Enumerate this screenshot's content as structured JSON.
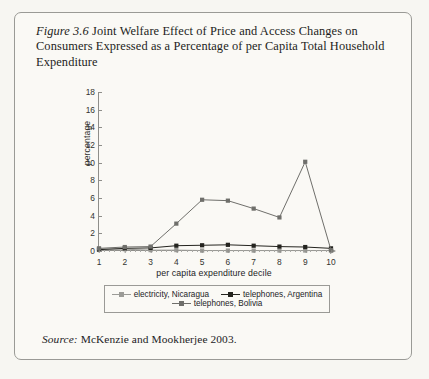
{
  "figure": {
    "number": "Figure 3.6",
    "title": " Joint Welfare Effect of Price and Access Changes on Consumers Expressed as a Percentage of per Capita Total Household Expenditure",
    "source_label": "Source:",
    "source_text": " McKenzie and Mookherjee 2003."
  },
  "chart_data": {
    "type": "line",
    "title": "",
    "xlabel": "per capita expenditure decile",
    "ylabel": "percentage",
    "categories": [
      1,
      2,
      3,
      4,
      5,
      6,
      7,
      8,
      9,
      10
    ],
    "x": [
      1,
      2,
      3,
      4,
      5,
      6,
      7,
      8,
      9,
      10
    ],
    "xlim": [
      1,
      10
    ],
    "ylim": [
      0,
      18
    ],
    "yticks": [
      0,
      2,
      4,
      6,
      8,
      10,
      12,
      14,
      16,
      18
    ],
    "xticks": [
      1,
      2,
      3,
      4,
      5,
      6,
      7,
      8,
      9,
      10
    ],
    "grid": false,
    "legend_position": "bottom",
    "series": [
      {
        "name": "electricity, Nicaragua",
        "color": "#9b9b97",
        "marker": "square",
        "values": [
          0.25,
          0.2,
          0.1,
          0.1,
          0.05,
          0.05,
          0.05,
          0.05,
          0.05,
          0.05
        ]
      },
      {
        "name": "telephones, Argentina",
        "color": "#24241f",
        "marker": "square",
        "values": [
          0.15,
          0.3,
          0.35,
          0.6,
          0.65,
          0.7,
          0.6,
          0.5,
          0.45,
          0.3
        ]
      },
      {
        "name": "telephones, Bolivia",
        "color": "#6f6f6b",
        "marker": "square",
        "values": [
          0.3,
          0.45,
          0.5,
          3.1,
          5.8,
          5.7,
          4.8,
          3.8,
          10.1,
          0.1
        ]
      }
    ]
  }
}
